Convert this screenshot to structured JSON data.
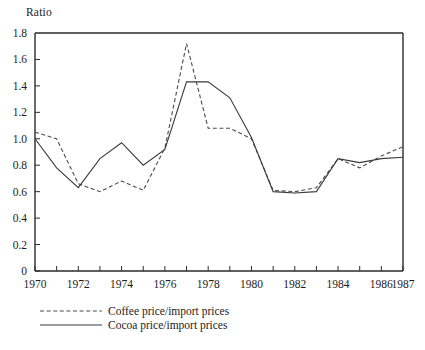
{
  "chart_data": {
    "type": "line",
    "title": "",
    "ylabel": "Ratio",
    "xlabel": "",
    "ylim": [
      0,
      1.8
    ],
    "xlim": [
      1970,
      1987
    ],
    "grid": false,
    "legend_position": "below-left",
    "y_ticks": [
      "0",
      "0.2",
      "0.4",
      "0.6",
      "0.8",
      "1.0",
      "1.2",
      "1.4",
      "1.6",
      "1.8"
    ],
    "y_tick_values": [
      0,
      0.2,
      0.4,
      0.6,
      0.8,
      1.0,
      1.2,
      1.4,
      1.6,
      1.8
    ],
    "x_ticks": [
      1970,
      1971,
      1972,
      1973,
      1974,
      1975,
      1976,
      1977,
      1978,
      1979,
      1980,
      1981,
      1982,
      1983,
      1984,
      1985,
      1986,
      1987
    ],
    "x_tick_labels": [
      "1970",
      "",
      "1972",
      "",
      "1974",
      "",
      "1976",
      "",
      "1978",
      "",
      "1980",
      "",
      "1982",
      "",
      "1984",
      "",
      "1986",
      "1987"
    ],
    "x": [
      1970,
      1971,
      1972,
      1973,
      1974,
      1975,
      1976,
      1977,
      1978,
      1979,
      1980,
      1981,
      1982,
      1983,
      1984,
      1985,
      1986,
      1987
    ],
    "series": [
      {
        "name": "Coffee price/import prices",
        "style": "dashed",
        "color": "#4a4a4a",
        "values": [
          1.05,
          1.0,
          0.66,
          0.6,
          0.68,
          0.61,
          0.93,
          1.72,
          1.08,
          1.08,
          1.0,
          0.61,
          0.6,
          0.63,
          0.85,
          0.78,
          0.87,
          0.94
        ]
      },
      {
        "name": "Cocoa price/import prices",
        "style": "solid",
        "color": "#3a3a3a",
        "values": [
          1.0,
          0.78,
          0.63,
          0.85,
          0.97,
          0.8,
          0.92,
          1.43,
          1.43,
          1.31,
          1.01,
          0.6,
          0.59,
          0.6,
          0.85,
          0.82,
          0.85,
          0.86
        ]
      }
    ]
  },
  "legend": {
    "items": [
      {
        "label": "Coffee price/import prices",
        "style": "dashed"
      },
      {
        "label": "Cocoa price/import prices",
        "style": "solid"
      }
    ]
  }
}
